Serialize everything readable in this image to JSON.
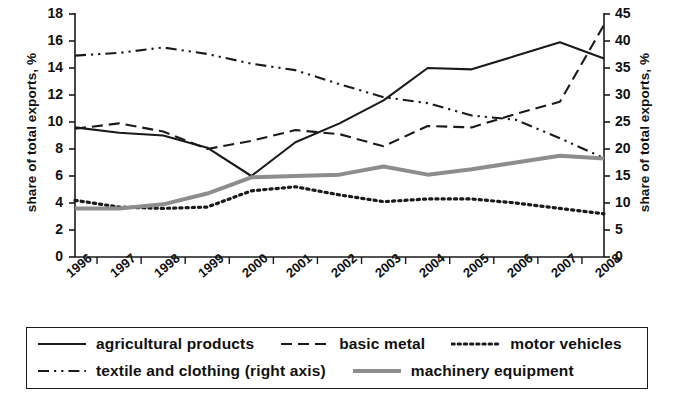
{
  "chart_data": {
    "type": "line",
    "title": "",
    "xlabel": "",
    "ylabel": "share of total exports, %",
    "ylabel_right": "share of total exports, %",
    "x": [
      "1996",
      "1997",
      "1998",
      "1999",
      "2000",
      "2001",
      "2002",
      "2003",
      "2004",
      "2005",
      "2006",
      "2007",
      "2008"
    ],
    "ylim": [
      0,
      18
    ],
    "yticks": [
      0,
      2,
      4,
      6,
      8,
      10,
      12,
      14,
      16,
      18
    ],
    "ylim_right": [
      0,
      45
    ],
    "yticks_right": [
      0,
      5,
      10,
      15,
      20,
      25,
      30,
      35,
      40,
      45
    ],
    "grid": false,
    "legend_position": "below",
    "series": [
      {
        "name": "agricultural products",
        "axis": "left",
        "style": "solid",
        "color": "#1a1a1a",
        "values": [
          9.6,
          9.2,
          9.0,
          8.1,
          6.0,
          8.5,
          9.9,
          11.6,
          14.0,
          13.9,
          14.9,
          15.9,
          14.7
        ]
      },
      {
        "name": "basic metal",
        "axis": "left",
        "style": "dashed",
        "color": "#1a1a1a",
        "values": [
          9.5,
          9.9,
          9.3,
          8.0,
          8.6,
          9.4,
          9.1,
          8.2,
          9.7,
          9.6,
          10.6,
          11.5,
          17.2
        ]
      },
      {
        "name": "motor vehicles",
        "axis": "left",
        "style": "dotted",
        "color": "#1a1a1a",
        "values": [
          4.2,
          3.7,
          3.6,
          3.7,
          4.9,
          5.2,
          4.6,
          4.1,
          4.3,
          4.3,
          4.0,
          3.6,
          3.2
        ]
      },
      {
        "name": "textile and clothing (right axis)",
        "axis": "right",
        "style": "dashdot",
        "color": "#1a1a1a",
        "values": [
          37.3,
          37.8,
          38.8,
          37.6,
          35.8,
          34.6,
          32.0,
          29.6,
          28.5,
          26.2,
          25.4,
          22.0,
          18.3
        ]
      },
      {
        "name": "machinery equipment",
        "axis": "left",
        "style": "solid-thick-grey",
        "color": "#8d8d8d",
        "values": [
          3.6,
          3.6,
          3.9,
          4.7,
          5.9,
          6.0,
          6.1,
          6.7,
          6.1,
          6.5,
          7.0,
          7.5,
          7.3
        ]
      }
    ]
  },
  "axis": {
    "left_title": "share of total exports, %",
    "right_title": "share of total exports, %",
    "left_ticks": [
      "18",
      "16",
      "14",
      "12",
      "10",
      "8",
      "6",
      "4",
      "2",
      "0"
    ],
    "right_ticks": [
      "45",
      "40",
      "35",
      "30",
      "25",
      "20",
      "15",
      "10",
      "5",
      "0"
    ],
    "x_ticks": [
      "1996",
      "1997",
      "1998",
      "1999",
      "2000",
      "2001",
      "2002",
      "2003",
      "2004",
      "2005",
      "2006",
      "2007",
      "2008"
    ]
  },
  "legend": {
    "row1": [
      {
        "label": "agricultural products",
        "key": "solid-line-key"
      },
      {
        "label": "basic metal",
        "key": "dashed-line-key"
      },
      {
        "label": "motor vehicles",
        "key": "dotted-line-key"
      }
    ],
    "row2": [
      {
        "label": "textile and clothing (right axis)",
        "key": "dashdot-line-key"
      },
      {
        "label": "machinery equipment",
        "key": "thick-grey-line-key"
      }
    ]
  }
}
